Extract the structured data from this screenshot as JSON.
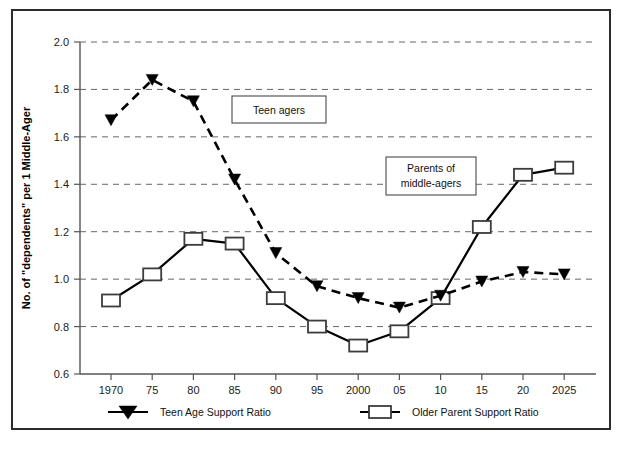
{
  "chart_data": {
    "type": "line",
    "title": "",
    "xlabel": "",
    "ylabel": "No. of \"dependents\" per 1 Middle-Ager",
    "ylim": [
      0.6,
      2.0
    ],
    "ytick_values": [
      0.6,
      0.8,
      1.0,
      1.2,
      1.4,
      1.6,
      1.8,
      2.0
    ],
    "ytick_labels": [
      "0.6",
      "0.8",
      "1.0",
      "1.2",
      "1.4",
      "1.6",
      "1.8",
      "2.0"
    ],
    "grid": "horizontal-dashed",
    "legend_position": "below-axis",
    "categories": [
      "1970",
      "75",
      "80",
      "85",
      "90",
      "95",
      "2000",
      "05",
      "10",
      "15",
      "20",
      "2025"
    ],
    "series": [
      {
        "name": "Teen Age Support Ratio",
        "marker": "filled-triangle-down",
        "line_style": "dashed",
        "color": "#000000",
        "values": [
          1.67,
          1.84,
          1.75,
          1.42,
          1.11,
          0.97,
          0.92,
          0.88,
          0.93,
          0.99,
          1.03,
          1.02
        ]
      },
      {
        "name": "Older Parent Support Ratio",
        "marker": "open-square",
        "line_style": "solid",
        "color": "#000000",
        "values": [
          0.91,
          1.02,
          1.17,
          1.15,
          0.92,
          0.8,
          0.72,
          0.78,
          0.92,
          1.22,
          1.44,
          1.47
        ]
      }
    ],
    "annotations": [
      {
        "text": "Teen agers",
        "lines": [
          "Teen agers"
        ],
        "x_category": "85",
        "y_value": 1.7
      },
      {
        "text": "Parents of middle-agers",
        "lines": [
          "Parents of",
          "middle-agers"
        ],
        "x_category": "10",
        "y_value": 1.44
      }
    ]
  },
  "legend": {
    "items": [
      {
        "label": "Teen Age Support Ratio",
        "marker": "filled-triangle-down"
      },
      {
        "label": "Older Parent Support Ratio",
        "marker": "open-square"
      }
    ]
  },
  "axis": {
    "y_title": "No. of \"dependents\" per 1 Middle-Ager",
    "y_labels": [
      "2.0",
      "1.8",
      "1.6",
      "1.4",
      "1.2",
      "1.0",
      "0.8",
      "0.6"
    ],
    "x_labels": [
      "1970",
      "75",
      "80",
      "85",
      "90",
      "95",
      "2000",
      "05",
      "10",
      "15",
      "20",
      "2025"
    ]
  },
  "annotations": {
    "teen": {
      "line1": "Teen agers"
    },
    "parents": {
      "line1": "Parents of",
      "line2": "middle-agers"
    }
  }
}
